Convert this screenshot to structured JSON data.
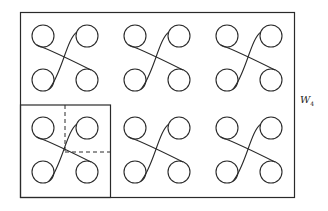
{
  "figure": {
    "label": "W",
    "label_subscript": "4",
    "stroke_color": "#2a2a2a",
    "background": "#ffffff",
    "grid": {
      "rows": 2,
      "cols": 3
    },
    "cells": [
      {
        "row": 0,
        "col": 0,
        "cx": 65,
        "cy": 58
      },
      {
        "row": 0,
        "col": 1,
        "cx": 157,
        "cy": 58
      },
      {
        "row": 0,
        "col": 2,
        "cx": 249,
        "cy": 58
      },
      {
        "row": 1,
        "col": 0,
        "cx": 65,
        "cy": 150
      },
      {
        "row": 1,
        "col": 1,
        "cx": 157,
        "cy": 150
      },
      {
        "row": 1,
        "col": 2,
        "cx": 249,
        "cy": 150
      }
    ],
    "highlighted_cell": {
      "row": 1,
      "col": 0,
      "fundamental_domain": "dashed quarter"
    }
  }
}
